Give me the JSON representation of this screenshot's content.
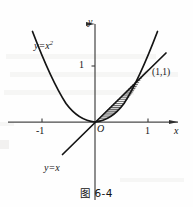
{
  "figure": {
    "caption": "图 6-4",
    "axes": {
      "x_axis_label": "x",
      "y_axis_label": "y",
      "origin_label": "O",
      "x_ticks": [
        {
          "value": -1,
          "label": "-1"
        },
        {
          "value": 1,
          "label": "1"
        }
      ],
      "y_ticks": [
        {
          "value": 1,
          "label": "1"
        }
      ],
      "xlim": [
        -1.8,
        1.55
      ],
      "ylim": [
        -1.25,
        1.85
      ]
    },
    "curves": [
      {
        "name": "parabola",
        "label": "y=x",
        "label_exponent": "2",
        "equation": "y = x^2",
        "style": "solid"
      },
      {
        "name": "line",
        "label": "y=x",
        "equation": "y = x",
        "style": "solid"
      }
    ],
    "points": [
      {
        "name": "intersection",
        "label": "(1,1)",
        "x": 1,
        "y": 1
      }
    ],
    "shaded_region": {
      "name": "area-between-curves",
      "between": [
        "y = x",
        "y = x^2"
      ],
      "from_x": 0,
      "to_x": 1,
      "hatch": "horizontal-lines"
    },
    "colors": {
      "ink": "#141414",
      "axis": "#4a4a4a",
      "background": "#fefefe",
      "hatch": "#2a2a2a"
    }
  }
}
